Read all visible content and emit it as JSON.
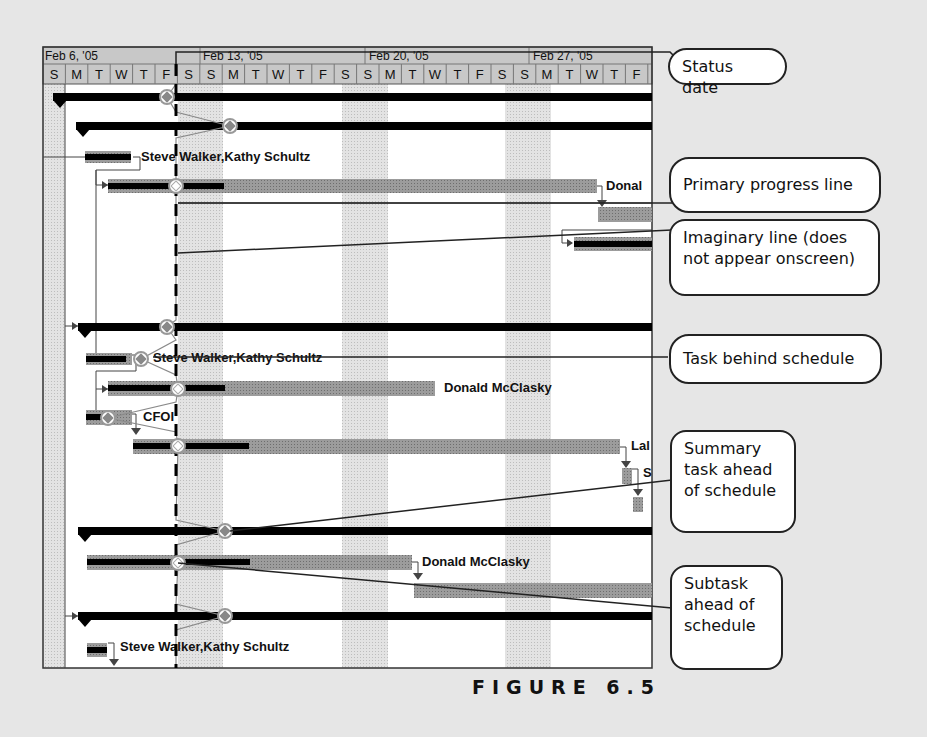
{
  "timescale": {
    "weeks": [
      {
        "label": "Feb 6, '05",
        "x": 45
      },
      {
        "label": "Feb 13, '05",
        "x": 202
      },
      {
        "label": "Feb 20, '05",
        "x": 368
      },
      {
        "label": "Feb 27, '05",
        "x": 532
      }
    ],
    "days": [
      "S",
      "M",
      "T",
      "W",
      "T",
      "F",
      "S",
      "S",
      "M",
      "T",
      "W",
      "T",
      "F",
      "S",
      "S",
      "M",
      "T",
      "W",
      "T",
      "F",
      "S",
      "S",
      "M",
      "T",
      "W",
      "T",
      "F"
    ]
  },
  "resource_labels": {
    "r1": "Steve Walker,Kathy Schultz",
    "r2": "Donal",
    "r3": "Steve Walker,Kathy Schultz",
    "r4": "Donald McClasky",
    "r5": "CFOI",
    "r6": "Lal",
    "r7": "S",
    "r8": "Donald McClasky",
    "r9": "Steve Walker,Kathy Schultz"
  },
  "callouts": {
    "status_date": "Status date",
    "primary_progress_line": "Primary progress line",
    "imaginary_line": "Imaginary line (does not appear onscreen)",
    "task_behind": "Task behind schedule",
    "summary_ahead": "Summary task ahead of schedule",
    "subtask_ahead": "Subtask ahead of schedule"
  },
  "figure": {
    "label": "FIGURE 6.5"
  },
  "colors": {
    "background": "#e6e6e6",
    "bar_gray": "#9a9a9a",
    "summary_black": "#000000",
    "nonworking_shade": "#d4d4d4"
  }
}
